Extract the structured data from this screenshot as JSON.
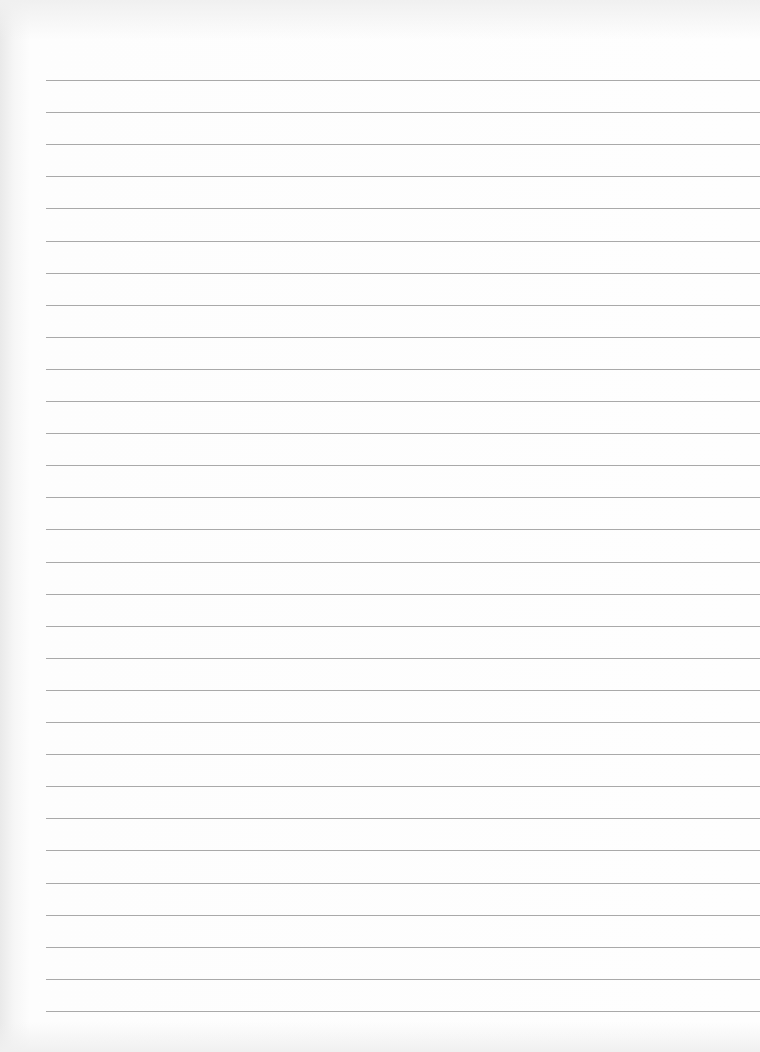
{
  "paper": {
    "type": "lined-paper",
    "background_color": "#fdfdfd",
    "rule_color": "#9a9a9a",
    "rule_count": 30,
    "first_rule_y": 80,
    "rule_spacing": 32.1,
    "left_margin_x": 46
  }
}
